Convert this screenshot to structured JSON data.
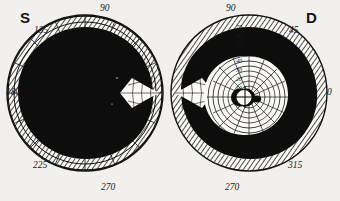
{
  "figure": {
    "type": "visual-field-perimetry",
    "background_color": "#f1f0ec",
    "ink_color": "#111111",
    "paper_color": "#fbfaf7",
    "charts_count": 2
  },
  "eye_labels": {
    "left_chart": "S",
    "right_chart": "D"
  },
  "left_chart": {
    "name": "left-eye-field",
    "center_x": 85,
    "center_y": 93,
    "radius_x": 78,
    "radius_y": 78,
    "meridian_labels": [
      {
        "text": "90",
        "x": 100,
        "y": 4,
        "angle": 90
      },
      {
        "text": "135",
        "x": 34,
        "y": 26,
        "angle": 135
      },
      {
        "text": "180",
        "x": 6,
        "y": 88,
        "angle": 180
      },
      {
        "text": "225",
        "x": 33,
        "y": 161,
        "angle": 225
      },
      {
        "text": "270",
        "x": 101,
        "y": 183,
        "angle": 270
      }
    ]
  },
  "right_chart": {
    "name": "right-eye-field",
    "center_x": 249,
    "center_y": 93,
    "radius_x": 78,
    "radius_y": 78,
    "meridian_labels": [
      {
        "text": "90",
        "x": 226,
        "y": 4,
        "angle": 90
      },
      {
        "text": "45",
        "x": 289,
        "y": 26,
        "angle": 45
      },
      {
        "text": "0",
        "x": 327,
        "y": 88,
        "angle": 0
      },
      {
        "text": "315",
        "x": 288,
        "y": 161,
        "angle": 315
      },
      {
        "text": "270",
        "x": 225,
        "y": 183,
        "angle": 270
      }
    ],
    "eccentricity_labels": [
      {
        "text": "70",
        "x": 236,
        "y": 24
      },
      {
        "text": "60",
        "x": 236,
        "y": 33
      },
      {
        "text": "50",
        "x": 236,
        "y": 42
      },
      {
        "text": "40",
        "x": 236,
        "y": 58
      },
      {
        "text": "30",
        "x": 236,
        "y": 67
      },
      {
        "text": "20",
        "x": 236,
        "y": 76
      },
      {
        "text": "10",
        "x": 236,
        "y": 85
      }
    ]
  },
  "chart_data": {
    "type": "scatter",
    "xlabel": "",
    "ylabel": "",
    "grid": true,
    "legend": "none",
    "coordinate_system": "polar",
    "angular_unit": "degrees",
    "radial_unit": "degrees of eccentricity",
    "radial_ticks": [
      10,
      20,
      30,
      40,
      50,
      60,
      70
    ],
    "angular_ticks": [
      0,
      45,
      90,
      135,
      180,
      225,
      270,
      315
    ],
    "panels": [
      {
        "name": "S",
        "eye": "left",
        "defect_fill": "dense-black-scotoma",
        "seeing_area_percent": 6,
        "hatched_band_present": true,
        "residual_island": "none",
        "blind_spot_visible": false
      },
      {
        "name": "D",
        "eye": "right",
        "defect_fill": "dense-black-scotoma",
        "seeing_area_percent": 28,
        "hatched_band_present": true,
        "residual_island": "central",
        "blind_spot_visible": true,
        "blind_spot_x_deg": 15,
        "blind_spot_y_deg": -2
      }
    ]
  }
}
